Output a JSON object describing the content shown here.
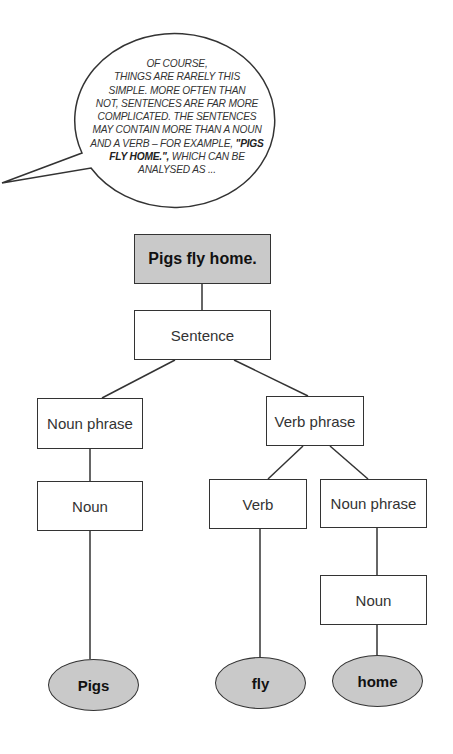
{
  "speech_bubble": {
    "lines": [
      "OF COURSE,",
      "THINGS ARE RARELY THIS",
      "SIMPLE. MORE OFTEN THAN",
      "NOT, SENTENCES ARE FAR MORE",
      "COMPLICATED. THE SENTENCES",
      "MAY CONTAIN MORE THAN A NOUN",
      "AND A VERB – FOR EXAMPLE, ",
      "FLY HOME.\",",
      " WHICH CAN BE",
      "ANALYSED AS ..."
    ],
    "emphasis_1": "\"PIGS",
    "emphasis_2": "FLY HOME.\","
  },
  "tree": {
    "root": "Pigs fly home.",
    "sentence": "Sentence",
    "noun_phrase_left": "Noun phrase",
    "noun_left": "Noun",
    "verb_phrase": "Verb phrase",
    "verb": "Verb",
    "noun_phrase_right": "Noun phrase",
    "noun_right": "Noun",
    "leaves": [
      "Pigs",
      "fly",
      "home"
    ]
  },
  "colors": {
    "fill_gray": "#c9c9c9",
    "stroke": "#333333"
  }
}
